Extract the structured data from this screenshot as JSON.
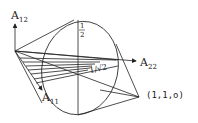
{
  "diagram": {
    "labels": {
      "a12": {
        "main": "A",
        "sub": "12"
      },
      "a22": {
        "main": "A",
        "sub": "22"
      },
      "a11": {
        "main": "A",
        "sub": "11"
      },
      "half_num": "1",
      "half_den": "2",
      "inv_sqrt2": "1/√2",
      "point": "(1,1,o)"
    },
    "colors": {
      "stroke": "#222222",
      "background": "#ffffff"
    }
  }
}
